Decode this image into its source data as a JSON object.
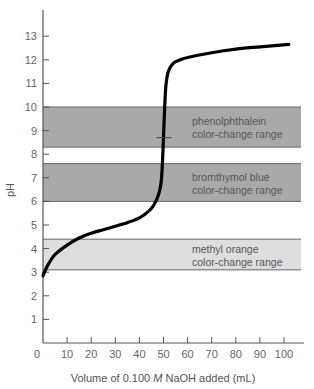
{
  "chart_data": {
    "type": "line",
    "title": "",
    "xlabel": "Volume of 0.100 M NaOH added (mL)",
    "xlabel_parts": {
      "pre": "Volume of 0.100 ",
      "italic": "M",
      "post": " NaOH added (mL)"
    },
    "ylabel": "pH",
    "xlim": [
      0,
      105
    ],
    "ylim": [
      0,
      14
    ],
    "x_ticks": [
      0,
      10,
      20,
      30,
      40,
      50,
      60,
      70,
      80,
      90,
      100
    ],
    "y_ticks": [
      1,
      2,
      3,
      4,
      5,
      6,
      7,
      8,
      9,
      10,
      11,
      12,
      13
    ],
    "grid": false,
    "series": [
      {
        "name": "Titration curve (weak acid with NaOH)",
        "x": [
          0,
          2,
          5,
          10,
          15,
          20,
          25,
          30,
          35,
          40,
          44,
          46,
          48,
          49,
          49.5,
          50,
          50.5,
          51,
          52,
          54,
          57,
          60,
          70,
          80,
          90,
          102
        ],
        "y": [
          2.85,
          3.3,
          3.75,
          4.15,
          4.45,
          4.65,
          4.8,
          4.95,
          5.1,
          5.3,
          5.6,
          5.85,
          6.3,
          6.8,
          7.5,
          8.7,
          10.0,
          10.9,
          11.5,
          11.85,
          12.0,
          12.1,
          12.3,
          12.45,
          12.55,
          12.65
        ],
        "color": "#000000"
      }
    ],
    "equivalence_marker": {
      "x": 50,
      "y": 8.7
    },
    "bands": [
      {
        "name": "phenolphthalein",
        "label_line1": "phenolphthalein",
        "label_line2": "color-change range",
        "ph_low": 8.3,
        "ph_high": 10.0,
        "color": "#a9a9a9"
      },
      {
        "name": "bromthymol blue",
        "label_line1": "bromthymol blue",
        "label_line2": "color-change range",
        "ph_low": 6.0,
        "ph_high": 7.6,
        "color": "#a9a9a9"
      },
      {
        "name": "methyl orange",
        "label_line1": "methyl orange",
        "label_line2": "color-change range",
        "ph_low": 3.1,
        "ph_high": 4.4,
        "color": "#dedede"
      }
    ]
  }
}
